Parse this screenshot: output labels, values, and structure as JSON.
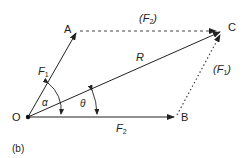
{
  "diagram": {
    "type": "parallelogram-of-forces",
    "points": {
      "O": {
        "label": "O",
        "x": 28,
        "y": 117
      },
      "A": {
        "label": "A",
        "x": 77,
        "y": 31
      },
      "B": {
        "label": "B",
        "x": 177,
        "y": 117
      },
      "C": {
        "label": "C",
        "x": 222,
        "y": 31
      }
    },
    "vectors": [
      {
        "from": "O",
        "to": "A",
        "label": "F",
        "sub": "1",
        "style": "solid"
      },
      {
        "from": "O",
        "to": "B",
        "label": "F",
        "sub": "2",
        "style": "solid"
      },
      {
        "from": "O",
        "to": "C",
        "label": "R",
        "sub": "",
        "style": "solid"
      },
      {
        "from": "A",
        "to": "C",
        "label": "(F",
        "sub": "2",
        "close": ")",
        "style": "dashed"
      },
      {
        "from": "B",
        "to": "C",
        "label": "(F",
        "sub": "1",
        "close": ")",
        "style": "dotted"
      }
    ],
    "angles": [
      {
        "symbol": "α",
        "between": [
          "OB",
          "OA"
        ]
      },
      {
        "symbol": "θ",
        "between": [
          "OB",
          "OC"
        ]
      }
    ],
    "caption": "(b)",
    "colors": {
      "line": "#222222",
      "background": "#ffffff"
    }
  }
}
